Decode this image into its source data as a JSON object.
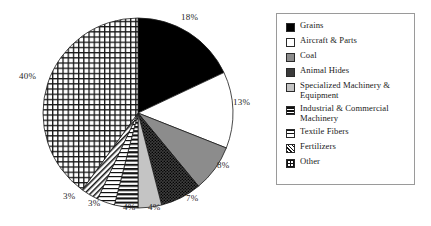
{
  "chart_data": {
    "type": "pie",
    "title": "",
    "legend_position": "right",
    "labels": [
      "Grains",
      "Aircraft & Parts",
      "Coal",
      "Animal Hides",
      "Specialized Machinery & Equipment",
      "Industrial & Commercial Machinery",
      "Textile Fibers",
      "Fertilizers",
      "Other"
    ],
    "values": [
      18,
      13,
      8,
      7,
      4,
      4,
      3,
      3,
      40
    ],
    "value_labels": [
      "18%",
      "13%",
      "8%",
      "7%",
      "4%",
      "4%",
      "3%",
      "3%",
      "40%"
    ],
    "units": "percent",
    "start_angle_deg": 0,
    "direction": "clockwise",
    "slice_patterns": [
      "solid-black",
      "white",
      "gray-mid",
      "dark-dot",
      "gray-light",
      "horizontal-bars",
      "horizontal-lines",
      "diagonal-hatch",
      "crosshatch"
    ]
  },
  "legend": {
    "items": [
      {
        "label": "Grains",
        "pattern": "solid-black"
      },
      {
        "label": "Aircraft & Parts",
        "pattern": "white"
      },
      {
        "label": "Coal",
        "pattern": "gray-mid"
      },
      {
        "label": "Animal Hides",
        "pattern": "dark-dot"
      },
      {
        "label": "Specialized Machinery & Equipment",
        "pattern": "gray-light"
      },
      {
        "label": "Industrial & Commercial Machinery",
        "pattern": "horizontal-bars"
      },
      {
        "label": "Textile Fibers",
        "pattern": "horizontal-lines"
      },
      {
        "label": "Fertilizers",
        "pattern": "diagonal-hatch"
      },
      {
        "label": "Other",
        "pattern": "crosshatch"
      }
    ]
  },
  "pie_labels": [
    {
      "text": "18%",
      "left": 181,
      "top": 12
    },
    {
      "text": "13%",
      "left": 233,
      "top": 97
    },
    {
      "text": "8%",
      "top": 160,
      "left": 217
    },
    {
      "text": "7%",
      "left": 186,
      "top": 193
    },
    {
      "text": "4%",
      "left": 148,
      "top": 202
    },
    {
      "text": "4%",
      "left": 123,
      "top": 202
    },
    {
      "text": "3%",
      "left": 88,
      "top": 198
    },
    {
      "text": "3%",
      "left": 63,
      "top": 191
    },
    {
      "text": "40%",
      "left": 19,
      "top": 71
    }
  ],
  "colors": {
    "black": "#000000",
    "gray_mid": "#8c8c8c",
    "gray_light": "#c4c4c4",
    "dark_dot": "#3a3a3a",
    "outline": "#1a1a1a",
    "legend_border": "#9a9a9a",
    "background": "#ffffff"
  }
}
